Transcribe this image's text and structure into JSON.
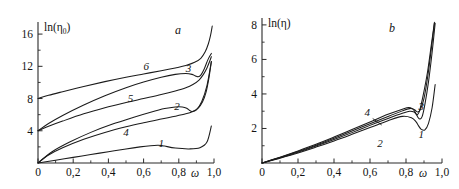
{
  "figure": {
    "panels": [
      "a",
      "b"
    ],
    "background": "#ffffff",
    "line_color": "#1b1b1b"
  },
  "chart_data": [
    {
      "type": "line",
      "panel_label": "a",
      "title": "",
      "xlabel": "ω",
      "ylabel": "ln(η₀)",
      "ylabel_base": "ln(η",
      "ylabel_sub": "0",
      "ylabel_close": ")",
      "xlim": [
        0,
        1.0
      ],
      "ylim": [
        0,
        17.5
      ],
      "grid": false,
      "legend": "inline-numeric-labels",
      "xticks": [
        0,
        0.2,
        0.4,
        0.6,
        0.8,
        1.0
      ],
      "xticklabels": [
        "0",
        "0,2",
        "0,4",
        "0,6",
        "0,8",
        "1,0"
      ],
      "xminorticks": [
        0.1,
        0.3,
        0.5,
        0.7,
        0.9
      ],
      "yticks": [
        4,
        8,
        12,
        16
      ],
      "yticklabels": [
        "4",
        "8",
        "12",
        "16"
      ],
      "yminorticks": [
        2,
        6,
        10,
        14
      ],
      "series": [
        {
          "name": "1",
          "label": "1",
          "label_pos": [
            0.7,
            2.0
          ],
          "x": [
            0.0,
            0.1,
            0.2,
            0.3,
            0.4,
            0.5,
            0.58,
            0.64,
            0.68,
            0.7,
            0.72,
            0.78,
            0.86,
            0.92,
            0.96,
            0.985
          ],
          "y": [
            0.0,
            0.35,
            0.7,
            1.05,
            1.4,
            1.75,
            2.0,
            2.15,
            2.2,
            2.18,
            2.1,
            1.85,
            1.75,
            1.9,
            2.6,
            4.6
          ]
        },
        {
          "name": "2",
          "label": "2",
          "label_pos": [
            0.79,
            6.6
          ],
          "x": [
            0.0,
            0.08,
            0.18,
            0.3,
            0.42,
            0.54,
            0.64,
            0.72,
            0.78,
            0.82,
            0.845,
            0.86,
            0.875,
            0.9,
            0.93,
            0.96,
            0.985
          ],
          "y": [
            0.0,
            1.4,
            2.6,
            3.8,
            4.8,
            5.65,
            6.3,
            6.75,
            6.95,
            6.95,
            6.8,
            6.55,
            6.4,
            6.6,
            7.6,
            9.6,
            12.6
          ]
        },
        {
          "name": "3",
          "label": "3",
          "label_pos": [
            0.855,
            11.3
          ],
          "x": [
            0.0,
            0.06,
            0.14,
            0.26,
            0.38,
            0.5,
            0.6,
            0.7,
            0.78,
            0.84,
            0.875,
            0.895,
            0.91,
            0.925,
            0.945,
            0.965,
            0.985
          ],
          "y": [
            4.0,
            4.9,
            5.9,
            7.2,
            8.35,
            9.35,
            10.05,
            10.65,
            11.0,
            11.1,
            11.0,
            10.8,
            10.7,
            10.9,
            11.7,
            12.8,
            13.6
          ]
        },
        {
          "name": "4",
          "label": "4",
          "label_pos": [
            0.5,
            3.4
          ],
          "x": [
            0.0,
            0.06,
            0.14,
            0.26,
            0.38,
            0.5,
            0.6,
            0.7,
            0.78,
            0.84,
            0.88,
            0.91,
            0.935,
            0.955,
            0.97,
            0.985
          ],
          "y": [
            0.0,
            1.0,
            1.9,
            2.95,
            3.8,
            4.5,
            5.0,
            5.45,
            5.8,
            6.1,
            6.4,
            6.8,
            7.6,
            8.8,
            10.4,
            12.6
          ]
        },
        {
          "name": "5",
          "label": "5",
          "label_pos": [
            0.525,
            7.6
          ],
          "x": [
            0.0,
            0.06,
            0.14,
            0.26,
            0.38,
            0.5,
            0.6,
            0.7,
            0.78,
            0.84,
            0.88,
            0.915,
            0.94,
            0.96,
            0.975,
            0.985
          ],
          "y": [
            4.0,
            4.55,
            5.2,
            6.1,
            6.85,
            7.5,
            8.0,
            8.5,
            8.95,
            9.35,
            9.75,
            10.3,
            11.0,
            11.8,
            12.6,
            13.2
          ]
        },
        {
          "name": "6",
          "label": "6",
          "label_pos": [
            0.615,
            11.6
          ],
          "x": [
            0.0,
            0.06,
            0.14,
            0.26,
            0.38,
            0.5,
            0.6,
            0.7,
            0.78,
            0.84,
            0.89,
            0.925,
            0.95,
            0.968,
            0.98,
            0.99
          ],
          "y": [
            8.0,
            8.4,
            8.85,
            9.5,
            10.1,
            10.65,
            11.05,
            11.45,
            11.8,
            12.1,
            12.5,
            13.0,
            13.8,
            14.8,
            15.8,
            17.0
          ]
        }
      ]
    },
    {
      "type": "line",
      "panel_label": "b",
      "title": "",
      "xlabel": "ω",
      "ylabel": "ln(η)",
      "xlim": [
        0,
        1.0
      ],
      "ylim": [
        0,
        8.4
      ],
      "grid": false,
      "legend": "inline-numeric-labels",
      "xticks": [
        0,
        0.2,
        0.4,
        0.6,
        0.8,
        1.0
      ],
      "xticklabels": [
        "0",
        "0,2",
        "0,4",
        "0,6",
        "0,8",
        "1,0"
      ],
      "xminorticks": [
        0.1,
        0.3,
        0.5,
        0.7,
        0.9
      ],
      "yticks": [
        2,
        4,
        6,
        8
      ],
      "yticklabels": [
        "2",
        "4",
        "6",
        "8"
      ],
      "yminorticks": [
        1,
        3,
        5,
        7
      ],
      "series": [
        {
          "name": "1",
          "label": "1",
          "label_pos": [
            0.885,
            1.45
          ],
          "x": [
            0.0,
            0.1,
            0.2,
            0.3,
            0.4,
            0.5,
            0.6,
            0.7,
            0.78,
            0.83,
            0.855,
            0.87,
            0.885,
            0.905,
            0.925,
            0.945,
            0.962
          ],
          "y": [
            0.0,
            0.28,
            0.58,
            0.92,
            1.28,
            1.66,
            2.05,
            2.45,
            2.7,
            2.62,
            2.4,
            2.15,
            1.95,
            1.92,
            2.3,
            3.2,
            4.55
          ]
        },
        {
          "name": "2",
          "label": "2",
          "label_pos": [
            0.655,
            0.95
          ],
          "x": [
            0.0,
            0.1,
            0.2,
            0.3,
            0.4,
            0.5,
            0.6,
            0.7,
            0.78,
            0.82,
            0.845,
            0.858,
            0.868,
            0.878,
            0.89,
            0.905,
            0.925,
            0.945,
            0.962
          ],
          "y": [
            0.0,
            0.3,
            0.62,
            0.98,
            1.36,
            1.76,
            2.18,
            2.58,
            2.88,
            3.0,
            2.95,
            2.8,
            2.62,
            2.55,
            2.7,
            3.4,
            4.7,
            6.4,
            8.1
          ]
        },
        {
          "name": "3",
          "label": "3",
          "label_pos": [
            0.885,
            3.05
          ],
          "x": [
            0.0,
            0.1,
            0.2,
            0.3,
            0.4,
            0.5,
            0.6,
            0.7,
            0.78,
            0.815,
            0.835,
            0.848,
            0.856,
            0.864,
            0.876,
            0.895,
            0.92,
            0.942,
            0.958
          ],
          "y": [
            0.0,
            0.34,
            0.7,
            1.08,
            1.5,
            1.94,
            2.38,
            2.82,
            3.12,
            3.22,
            3.15,
            3.0,
            2.85,
            2.8,
            3.05,
            3.9,
            5.3,
            6.95,
            8.15
          ]
        },
        {
          "name": "4",
          "label": "4",
          "label_pos": [
            0.585,
            2.75
          ],
          "leader": [
            [
              0.615,
              2.58
            ],
            [
              0.665,
              2.2
            ]
          ],
          "x": [
            0.0,
            0.1,
            0.2,
            0.3,
            0.4,
            0.5,
            0.6,
            0.7,
            0.78,
            0.82,
            0.843,
            0.855,
            0.866,
            0.88,
            0.9,
            0.922,
            0.944,
            0.958
          ],
          "y": [
            0.0,
            0.32,
            0.66,
            1.03,
            1.43,
            1.85,
            2.28,
            2.7,
            3.02,
            3.15,
            3.12,
            3.02,
            2.96,
            3.1,
            3.75,
            5.1,
            6.9,
            8.1
          ]
        }
      ]
    }
  ]
}
